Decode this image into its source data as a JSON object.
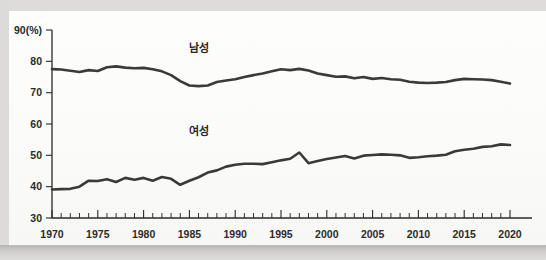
{
  "figure": {
    "background_color": "#d9d9d7",
    "panel_color": "#fbfbfa",
    "line_color": "#3a3a3a"
  },
  "chart_data": {
    "type": "line",
    "title": "",
    "subtitle": "",
    "xlabel": "",
    "ylabel": "",
    "unit_label": "90(%)",
    "y_axis_unit": "%",
    "xlim": [
      1970,
      2020
    ],
    "ylim": [
      30,
      90
    ],
    "grid": false,
    "legend_position": "inline-annotation",
    "y_ticks": [
      30,
      40,
      50,
      60,
      70,
      80,
      90
    ],
    "y_tick_labels": [
      "30",
      "40",
      "50",
      "60",
      "70",
      "80",
      "90(%)"
    ],
    "x_ticks": [
      1970,
      1975,
      1980,
      1985,
      1990,
      1995,
      2000,
      2005,
      2010,
      2015,
      2020
    ],
    "x_tick_labels": [
      "1970",
      "1975",
      "1980",
      "1985",
      "1990",
      "1995",
      "2000",
      "2005",
      "2010",
      "2015",
      "2020"
    ],
    "x_minor_tick_interval": 1,
    "annotations": [
      {
        "text": "남성",
        "x": 1986,
        "y": 83.0
      },
      {
        "text": "여성",
        "x": 1986,
        "y": 56.5
      }
    ],
    "x": [
      1970,
      1971,
      1972,
      1973,
      1974,
      1975,
      1976,
      1977,
      1978,
      1979,
      1980,
      1981,
      1982,
      1983,
      1984,
      1985,
      1986,
      1987,
      1988,
      1989,
      1990,
      1991,
      1992,
      1993,
      1994,
      1995,
      1996,
      1997,
      1998,
      1999,
      2000,
      2001,
      2002,
      2003,
      2004,
      2005,
      2006,
      2007,
      2008,
      2009,
      2010,
      2011,
      2012,
      2013,
      2014,
      2015,
      2016,
      2017,
      2018,
      2019,
      2020
    ],
    "series": [
      {
        "name": "남성",
        "name_en": "Male",
        "color": "#3a3a3a",
        "values": [
          77.5,
          77.4,
          77.0,
          76.6,
          77.2,
          76.9,
          78.1,
          78.4,
          78.0,
          77.8,
          77.9,
          77.5,
          76.8,
          75.6,
          73.7,
          72.3,
          72.1,
          72.3,
          73.4,
          73.9,
          74.3,
          75.0,
          75.6,
          76.1,
          76.8,
          77.5,
          77.2,
          77.6,
          77.1,
          76.1,
          75.6,
          75.1,
          75.2,
          74.6,
          75.0,
          74.4,
          74.7,
          74.3,
          74.1,
          73.5,
          73.2,
          73.1,
          73.2,
          73.4,
          74.0,
          74.4,
          74.3,
          74.2,
          74.0,
          73.5,
          72.9
        ]
      },
      {
        "name": "여성",
        "name_en": "Female",
        "color": "#3a3a3a",
        "values": [
          39.1,
          39.2,
          39.3,
          40.0,
          41.9,
          41.8,
          42.4,
          41.5,
          42.8,
          42.2,
          42.8,
          41.9,
          43.1,
          42.5,
          40.6,
          41.9,
          43.0,
          44.5,
          45.2,
          46.4,
          47.0,
          47.3,
          47.3,
          47.2,
          47.8,
          48.4,
          48.9,
          50.9,
          47.5,
          48.2,
          48.8,
          49.3,
          49.8,
          49.0,
          49.9,
          50.1,
          50.3,
          50.2,
          50.0,
          49.2,
          49.4,
          49.7,
          49.9,
          50.2,
          51.3,
          51.8,
          52.1,
          52.7,
          52.9,
          53.5,
          53.3
        ]
      }
    ]
  }
}
